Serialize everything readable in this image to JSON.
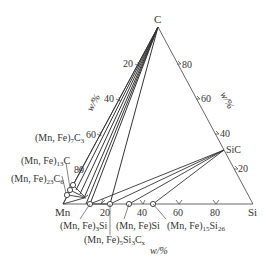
{
  "vertices": {
    "top": "C",
    "left": "Mn",
    "right": "Si"
  },
  "axes": {
    "left_edge_label": "w/%",
    "right_edge_label": "w/%",
    "bottom_edge_label": "w/%",
    "left_ticks": [
      "20",
      "40",
      "60",
      "80"
    ],
    "right_ticks": [
      "80",
      "60",
      "40",
      "20"
    ],
    "bottom_ticks": [
      "20",
      "40",
      "60",
      "80"
    ]
  },
  "compounds": {
    "c7c3": "(Mn, Fe)7C3",
    "c13c": "(Mn, Fe)13C",
    "c23c6": "(Mn, Fe)23C6",
    "mn3si": "(Mn, Fe)3Si",
    "mn5si3cx": "(Mn, Fe)5Si3Cx",
    "mnsi": "(Mn, Fe)Si",
    "mn15si26": "(Mn, Fe)15Si26",
    "sic": "SiC"
  },
  "colors": {
    "line": "#333333",
    "thin_line": "#555555"
  }
}
